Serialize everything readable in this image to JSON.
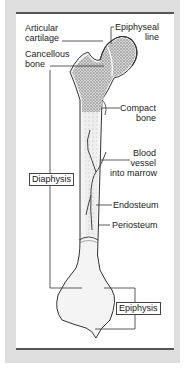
{
  "diagram": {
    "colors": {
      "background": "#dedede",
      "panel": "#ffffff",
      "rule": "#555555",
      "bone_outline": "#333333",
      "cancellous_fill": "#b8b8b8",
      "marrow_fill": "#e4e4e4",
      "text": "#222222"
    },
    "labels": {
      "articular_cartilage": [
        "Articular",
        "cartilage"
      ],
      "cancellous_bone": [
        "Cancellous",
        "bone"
      ],
      "epiphyseal_line": [
        "Epiphyseal",
        "line"
      ],
      "compact_bone": [
        "Compact",
        "bone"
      ],
      "blood_vessel": [
        "Blood",
        "vessel",
        "into marrow"
      ],
      "endosteum": "Endosteum",
      "periosteum": "Periosteum"
    },
    "boxed_labels": {
      "diaphysis": "Diaphysis",
      "epiphysis": "Epiphysis"
    }
  }
}
